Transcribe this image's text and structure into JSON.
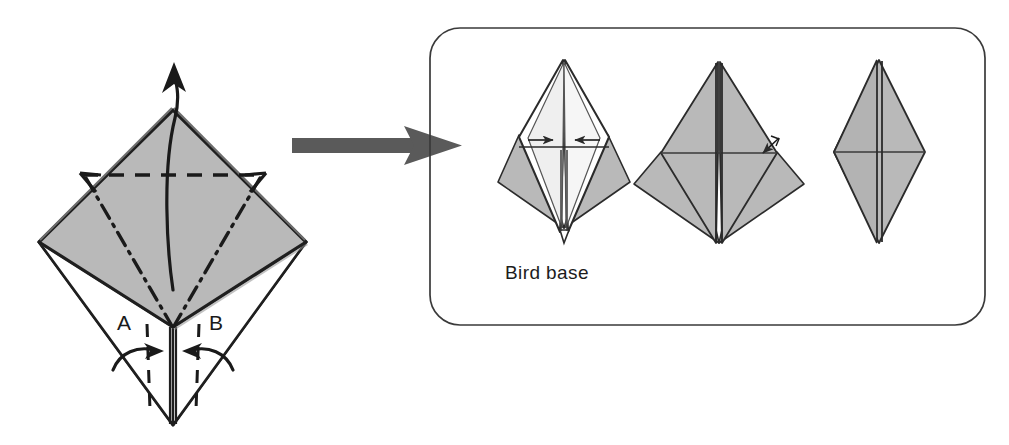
{
  "figure": {
    "type": "origami-instruction-diagram",
    "background_color": "#ffffff"
  },
  "palette": {
    "paper_gray": "#b9b9b9",
    "paper_gray_dark": "#a8a8a8",
    "paper_white": "#ffffff",
    "ink": "#1a1a1a",
    "outline": "#222222",
    "transition_arrow": "#5a5a5a",
    "panel_border": "#3a3a3a",
    "edge_shadow": "#8f8f8f"
  },
  "left_diagram": {
    "name": "preliminary-base-with-petal-fold",
    "labels": [
      {
        "id": "A",
        "text": "A",
        "x": 124,
        "y": 330
      },
      {
        "id": "B",
        "text": "B",
        "x": 216,
        "y": 330
      }
    ],
    "geometry": {
      "top_vertex": {
        "x": 173,
        "y": 110
      },
      "left_vertex": {
        "x": 39,
        "y": 242
      },
      "right_vertex": {
        "x": 306,
        "y": 242
      },
      "center_point": {
        "x": 173,
        "y": 327
      },
      "bottom_tip": {
        "x": 173,
        "y": 425
      }
    },
    "annotations": {
      "valley_fold_line": "horizontal dashed line across upper diamond",
      "mountain_fold_lines": "dash-dot V from dashed line corners to center",
      "petal_arrow": "curved arrow lifting front flap upward",
      "flap_arrows": "two curved arrows folding flaps A and B inward"
    }
  },
  "transition_arrow": {
    "name": "process-arrow",
    "direction": "right",
    "start_x": 292,
    "end_x": 462,
    "y": 145
  },
  "result_panel": {
    "name": "bird-base-panel",
    "caption": "Bird base",
    "border_radius": 30,
    "bounds": {
      "x": 430,
      "y": 28,
      "width": 555,
      "height": 297
    },
    "figures": [
      {
        "id": "bird-base-front",
        "label": "bird base front view",
        "center_x": 564,
        "has_arrows": true,
        "arrow_count": 2
      },
      {
        "id": "bird-base-flattened",
        "label": "bird base flattened",
        "center_x": 719,
        "has_arrows": true,
        "arrow_count": 1
      },
      {
        "id": "bird-base-narrow",
        "label": "bird base narrowed rhombus",
        "center_x": 880,
        "has_arrows": false,
        "arrow_count": 0
      }
    ]
  }
}
